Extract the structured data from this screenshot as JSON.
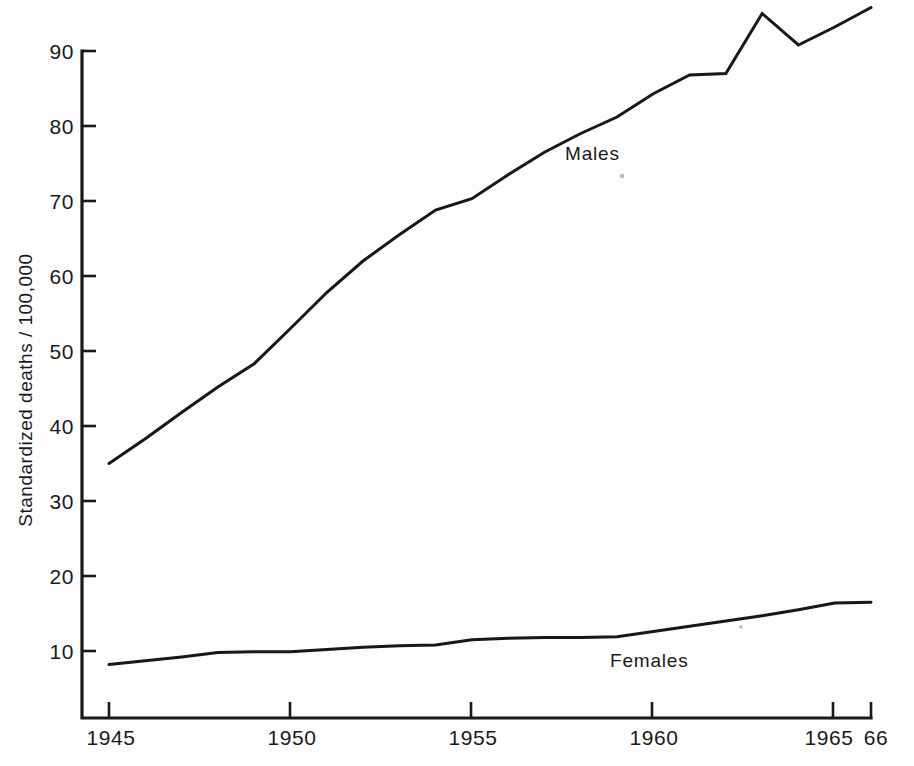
{
  "chart_data": {
    "type": "line",
    "title": "",
    "subtitle": "",
    "xlabel": "",
    "ylabel": "Standardized deaths / 100,000",
    "xlim": [
      1945,
      1966
    ],
    "ylim": [
      0,
      95
    ],
    "grid": false,
    "legend_position": "inline-annotation",
    "x": [
      1945,
      1946,
      1947,
      1948,
      1949,
      1950,
      1951,
      1952,
      1953,
      1954,
      1955,
      1956,
      1957,
      1958,
      1959,
      1960,
      1961,
      1962,
      1963,
      1964,
      1965,
      1966
    ],
    "x_tick_labels": [
      "1945",
      "1950",
      "1955",
      "1960",
      "1965",
      "66"
    ],
    "x_tick_values": [
      1945,
      1950,
      1955,
      1960,
      1965,
      1966
    ],
    "y_tick_labels": [
      "10",
      "20",
      "30",
      "40",
      "50",
      "60",
      "70",
      "80",
      "90"
    ],
    "y_tick_values": [
      10,
      20,
      30,
      40,
      50,
      60,
      70,
      80,
      90
    ],
    "series": [
      {
        "name": "Males",
        "label": "Males",
        "label_x": 1957.1,
        "label_y": 74.5,
        "color": "#17171a",
        "values": [
          35.0,
          38.3,
          41.8,
          45.2,
          48.3,
          53.0,
          57.8,
          62.0,
          65.5,
          68.8,
          70.3,
          73.5,
          76.5,
          79.0,
          81.2,
          84.3,
          86.8,
          87.0,
          95.0,
          90.8,
          93.2,
          95.8
        ]
      },
      {
        "name": "Females",
        "label": "Females",
        "label_x": 1959.1,
        "label_y": 8.6,
        "color": "#17171a",
        "values": [
          8.2,
          8.7,
          9.2,
          9.8,
          9.9,
          9.9,
          10.2,
          10.5,
          10.7,
          10.8,
          11.5,
          11.7,
          11.8,
          11.8,
          11.9,
          12.6,
          13.3,
          14.0,
          14.7,
          15.5,
          16.4,
          16.5
        ]
      }
    ]
  },
  "axes": {
    "y_axis_label": "Standardized deaths / 100,000",
    "x_axis_end_label": "66"
  }
}
